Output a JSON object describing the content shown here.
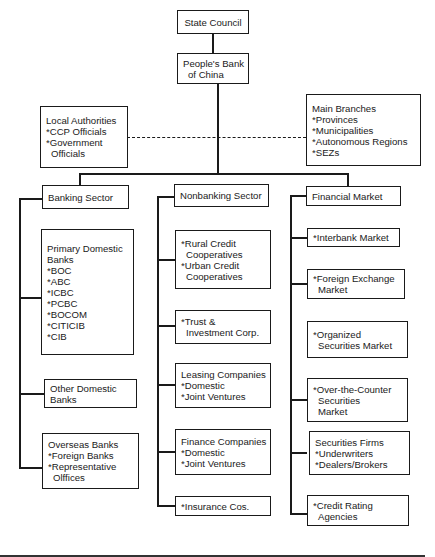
{
  "diagram": {
    "type": "organization-chart",
    "line_color": "#1a1a1a",
    "top": {
      "state_council": {
        "lines": [
          "State Council"
        ]
      },
      "pboc": {
        "lines": [
          "People's Bank",
          "of China"
        ]
      }
    },
    "side": {
      "local_authorities": {
        "lines": [
          "Local Authorities",
          "*CCP Officials",
          "*Government",
          "Officials"
        ]
      },
      "main_branches": {
        "lines": [
          "Main Branches",
          "*Provinces",
          "*Municipalities",
          "*Autonomous Regions",
          "*SEZs"
        ]
      }
    },
    "sectors": [
      {
        "title": "Banking Sector",
        "children": [
          {
            "lines": [
              "Primary Domestic",
              "Banks",
              "*BOC",
              "*ABC",
              "*ICBC",
              "*PCBC",
              "*BOCOM",
              "*CITICIB",
              "*CIB"
            ]
          },
          {
            "lines": [
              "Other Domestic",
              "Banks"
            ]
          },
          {
            "lines": [
              "Overseas Banks",
              "*Foreign Banks",
              "*Representative",
              "Olffices"
            ]
          }
        ]
      },
      {
        "title": "Nonbanking Sector",
        "children": [
          {
            "lines": [
              "*Rural Credit",
              "Cooperatives",
              "*Urban Credit",
              "Cooperatives"
            ]
          },
          {
            "lines": [
              "*Trust &",
              "Investment Corp."
            ]
          },
          {
            "lines": [
              "Leasing Companies",
              "*Domestic",
              "*Joint Ventures"
            ]
          },
          {
            "lines": [
              "Finance Companies",
              "*Domestic",
              "*Joint Ventures"
            ]
          },
          {
            "lines": [
              "*Insurance Cos."
            ]
          }
        ]
      },
      {
        "title": "Financial Market",
        "children": [
          {
            "lines": [
              "*Interbank Market"
            ]
          },
          {
            "lines": [
              "*Foreign Exchange",
              "Market"
            ]
          },
          {
            "lines": [
              "*Organized",
              "Securities Market"
            ]
          },
          {
            "lines": [
              "*Over-the-Counter",
              "Securities",
              "Market"
            ]
          },
          {
            "lines": [
              "Securities Firms",
              "*Underwriters",
              "*Dealers/Brokers"
            ]
          },
          {
            "lines": [
              "*Credit Rating",
              "Agencies"
            ]
          }
        ]
      }
    ]
  }
}
